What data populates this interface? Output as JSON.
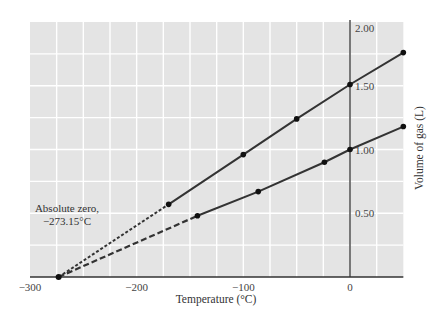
{
  "chart_data": {
    "type": "line",
    "title": "",
    "xlabel": "Temperature (°C)",
    "ylabel": "Volume of gas (L)",
    "xlim": [
      -300,
      50
    ],
    "ylim": [
      0,
      2.0
    ],
    "x_ticks": [
      -300,
      -200,
      -100,
      0
    ],
    "x_tick_labels": [
      "−300",
      "−200",
      "−100",
      "0"
    ],
    "y_ticks": [
      0.5,
      1.0,
      1.5,
      2.0
    ],
    "y_tick_labels": [
      "0.50",
      "1.00",
      "1.50",
      "2.00"
    ],
    "grid": true,
    "grid_x_step": 25,
    "grid_y_step": 0.25,
    "legend": null,
    "series": [
      {
        "name": "Gas sample A",
        "x": [
          -170,
          -100,
          -50,
          0,
          50
        ],
        "y": [
          0.57,
          0.96,
          1.24,
          1.51,
          1.76
        ],
        "extrapolation": {
          "x": [
            -273.15,
            -170
          ],
          "y": [
            0,
            0.57
          ],
          "style": "dashed"
        }
      },
      {
        "name": "Gas sample B",
        "x": [
          -143,
          -86,
          -24,
          0,
          50
        ],
        "y": [
          0.48,
          0.67,
          0.9,
          1.0,
          1.18
        ],
        "extrapolation": {
          "x": [
            -273.15,
            -143
          ],
          "y": [
            0,
            0.48
          ],
          "style": "dashed"
        }
      }
    ],
    "annotations": [
      {
        "text": [
          "Absolute zero,",
          "−273.15°C"
        ],
        "x": -273.15,
        "y": 0,
        "marker": true
      }
    ]
  },
  "colors": {
    "plot_background": "#e4e4e4",
    "grid": "#ffffff",
    "line": "#333333",
    "axis": "#333333",
    "text": "#444444"
  }
}
